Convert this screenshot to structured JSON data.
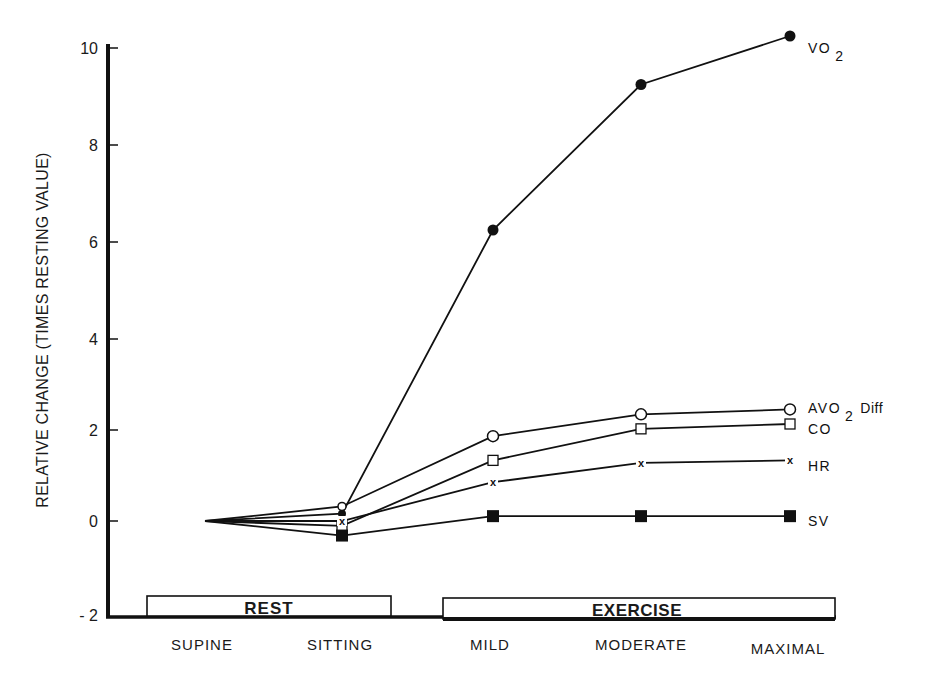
{
  "chart_data": {
    "type": "line",
    "title": "",
    "xlabel": "",
    "ylabel": "RELATIVE CHANGE (TIMES RESTING VALUE)",
    "ylim": [
      -2,
      10
    ],
    "yticks": [
      -2,
      0,
      2,
      4,
      6,
      8,
      10
    ],
    "ytick_labels": [
      "- 2",
      "0",
      "2",
      "4",
      "6",
      "8",
      "10"
    ],
    "grid": false,
    "legend_position": "inline-right",
    "categories": [
      "SUPINE",
      "SITTING",
      "MILD",
      "MODERATE",
      "MAXIMAL"
    ],
    "groups": [
      {
        "label": "REST",
        "categories": [
          "SUPINE",
          "SITTING"
        ]
      },
      {
        "label": "EXERCISE",
        "categories": [
          "MILD",
          "MODERATE",
          "MAXIMAL"
        ]
      }
    ],
    "series": [
      {
        "name": "VO2",
        "label": "VO",
        "label_sub": "2",
        "label_suffix": "",
        "marker": "filled-circle",
        "values": [
          0,
          0.15,
          6.0,
          9.0,
          10.0
        ]
      },
      {
        "name": "AVO2 Diff",
        "label": "AVO",
        "label_sub": "2",
        "label_suffix": "Diff",
        "marker": "open-circle",
        "values": [
          0,
          0.3,
          1.75,
          2.2,
          2.3
        ]
      },
      {
        "name": "CO",
        "label": "CO",
        "label_sub": "",
        "label_suffix": "",
        "marker": "open-square",
        "values": [
          0,
          -0.1,
          1.25,
          1.9,
          2.0
        ]
      },
      {
        "name": "HR",
        "label": "HR",
        "label_sub": "",
        "label_suffix": "",
        "marker": "x",
        "values": [
          0,
          0.0,
          0.8,
          1.2,
          1.25
        ]
      },
      {
        "name": "SV",
        "label": "SV",
        "label_sub": "",
        "label_suffix": "",
        "marker": "filled-square",
        "values": [
          0,
          -0.3,
          0.1,
          0.1,
          0.1
        ]
      }
    ]
  },
  "colors": {
    "ink": "#111111",
    "background": "#ffffff"
  }
}
